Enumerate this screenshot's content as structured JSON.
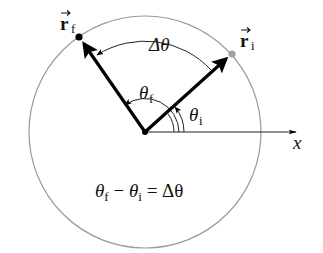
{
  "diagram": {
    "type": "angular-displacement",
    "labels": {
      "r_final": "r",
      "r_final_sub": "f",
      "r_initial": "r",
      "r_initial_sub": "i",
      "delta_theta": "Δθ",
      "theta_f": "θ",
      "theta_f_sub": "f",
      "theta_i": "θ",
      "theta_i_sub": "i",
      "x_axis": "x",
      "eq_theta1": "θ",
      "eq_sub1": "f",
      "eq_minus": " − ",
      "eq_theta2": "θ",
      "eq_sub2": "i",
      "eq_rest": " = Δθ"
    },
    "equation": "θf − θi = Δθ",
    "colors": {
      "circle": "#9a9a9a",
      "vector": "#000000",
      "initial_point": "#a0a0a0",
      "final_point": "#000000",
      "text": "#111111"
    }
  }
}
